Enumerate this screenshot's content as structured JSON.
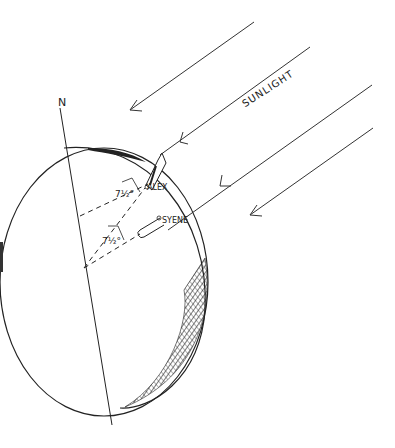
{
  "diagram": {
    "labels": {
      "north": "N",
      "sunlight": "SUNLIGHT",
      "alexandria": "ALEX",
      "syene": "SYENE",
      "angle_at_alex": "7½°",
      "angle_at_center": "7½°"
    },
    "colors": {
      "ink": "#222222",
      "background": "#ffffff"
    },
    "elements": [
      "earth-globe",
      "earth-axis",
      "sun-rays",
      "alexandria-gnomon",
      "syene-well",
      "dashed-radii"
    ]
  }
}
